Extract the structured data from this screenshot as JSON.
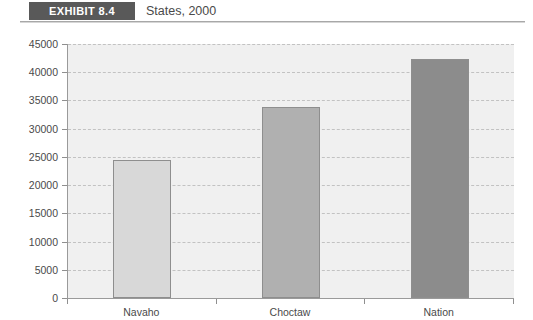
{
  "header": {
    "badge_label": "EXHIBIT 8.4",
    "title": "States, 2000",
    "badge_color": "#595959"
  },
  "chart_data": {
    "type": "bar",
    "title": "States, 2000",
    "categories": [
      "Navaho",
      "Choctaw",
      "Nation"
    ],
    "values": [
      24400,
      33900,
      42300
    ],
    "series": [
      {
        "name": "States, 2000",
        "values": [
          24400,
          33900,
          42300
        ]
      }
    ],
    "xlabel": "",
    "ylabel": "",
    "ylim": [
      0,
      45000
    ],
    "ytick_values": [
      0,
      5000,
      10000,
      15000,
      20000,
      25000,
      30000,
      35000,
      40000,
      45000
    ],
    "ytick_labels": [
      "0",
      "5000",
      "10000",
      "15000",
      "20000",
      "25000",
      "30000",
      "35000",
      "40000",
      "45000"
    ],
    "grid": true,
    "grid_style": "dashed",
    "legend": false,
    "bar_colors": [
      "#d8d8d8",
      "#b0b0b0",
      "#8c8c8c"
    ],
    "plot_background": "#f0f0f0",
    "axis_color": "#9a9a9a",
    "gridline_color": "#c2c2c2"
  }
}
